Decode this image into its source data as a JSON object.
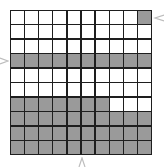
{
  "figure": {
    "rows": 10,
    "cols": 10,
    "colors": {
      "shaded": "#9a9a9a",
      "empty": "#ffffff",
      "line": "#1e1e1e"
    },
    "grid": [
      [
        0,
        0,
        0,
        0,
        0,
        0,
        0,
        0,
        0,
        1
      ],
      [
        0,
        0,
        0,
        0,
        0,
        0,
        0,
        0,
        0,
        0
      ],
      [
        0,
        0,
        0,
        0,
        0,
        0,
        0,
        0,
        0,
        0
      ],
      [
        1,
        1,
        1,
        1,
        1,
        1,
        1,
        1,
        1,
        1
      ],
      [
        0,
        0,
        0,
        0,
        0,
        0,
        0,
        0,
        0,
        0
      ],
      [
        0,
        0,
        0,
        0,
        0,
        0,
        0,
        0,
        0,
        0
      ],
      [
        1,
        1,
        1,
        1,
        1,
        1,
        1,
        0,
        0,
        0
      ],
      [
        1,
        1,
        1,
        1,
        1,
        1,
        1,
        1,
        1,
        1
      ],
      [
        1,
        1,
        1,
        1,
        1,
        1,
        1,
        1,
        1,
        1
      ],
      [
        1,
        1,
        1,
        1,
        1,
        1,
        1,
        1,
        1,
        1
      ]
    ],
    "shaded_count": 48,
    "markers": [
      {
        "name": "right-arrow",
        "points_to": "row 1 / col 10 cell"
      },
      {
        "name": "left-arrow",
        "points_to": "row 4"
      },
      {
        "name": "bottom-arrow",
        "points_to": "column 6"
      }
    ]
  }
}
